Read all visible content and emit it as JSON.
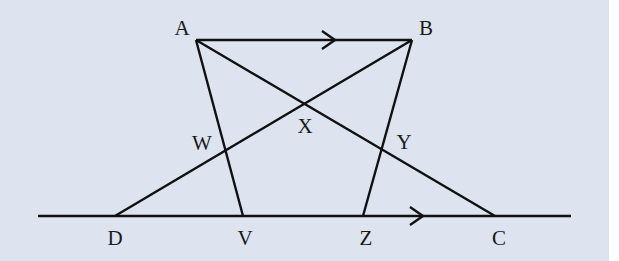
{
  "diagram": {
    "background_color": "#dde4ef",
    "line_color": "#111111",
    "points": {
      "A": {
        "label": "A",
        "x": 196,
        "y": 40,
        "lx": 182,
        "ly": 30
      },
      "B": {
        "label": "B",
        "x": 412,
        "y": 40,
        "lx": 426,
        "ly": 30
      },
      "W": {
        "label": "W",
        "x": 225,
        "y": 150,
        "lx": 202,
        "ly": 145
      },
      "X": {
        "label": "X",
        "x": 304,
        "y": 104,
        "lx": 305,
        "ly": 128
      },
      "Y": {
        "label": "Y",
        "x": 381,
        "y": 150,
        "lx": 404,
        "ly": 144
      },
      "D": {
        "label": "D",
        "x": 115,
        "y": 216,
        "lx": 115,
        "ly": 240
      },
      "V": {
        "label": "V",
        "x": 243,
        "y": 216,
        "lx": 245,
        "ly": 240
      },
      "Z": {
        "label": "Z",
        "x": 363,
        "y": 216,
        "lx": 366,
        "ly": 240
      },
      "C": {
        "label": "C",
        "x": 495,
        "y": 216,
        "lx": 499,
        "ly": 240
      }
    },
    "segments": [
      {
        "name": "AB",
        "from": "A",
        "to": "B",
        "parallel_arrow": true
      },
      {
        "name": "AV",
        "from": "A",
        "to": "V"
      },
      {
        "name": "AC",
        "from": "A",
        "to": "C"
      },
      {
        "name": "BD",
        "from": "B",
        "to": "D"
      },
      {
        "name": "BZ",
        "from": "B",
        "to": "Z"
      }
    ],
    "base_line": {
      "name": "line-DC",
      "x1": 38,
      "x2": 571,
      "y": 216,
      "parallel_arrow": true
    },
    "parallel_marks": [
      {
        "on": "AB",
        "tip_x": 335,
        "y": 40
      },
      {
        "on": "DC",
        "tip_x": 423,
        "y": 216
      }
    ]
  }
}
